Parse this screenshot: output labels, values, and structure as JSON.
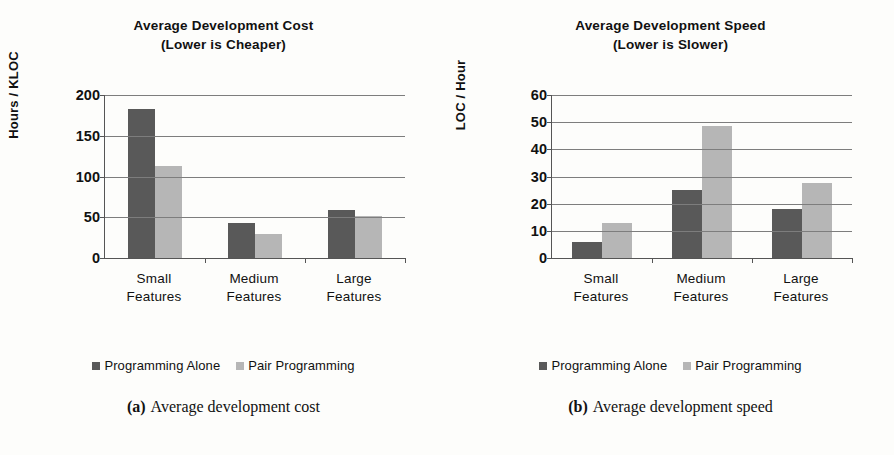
{
  "figures": [
    {
      "key": "cost",
      "title_line1": "Average Development Cost",
      "title_line2": "(Lower is Cheaper)",
      "caption_label": "(a)",
      "caption_text": "Average development cost",
      "legend": [
        {
          "label": "Programming Alone",
          "color": "#595959",
          "swatch": "dark"
        },
        {
          "label": "Pair Programming",
          "color": "#b6b6b6",
          "swatch": "light"
        }
      ]
    },
    {
      "key": "speed",
      "title_line1": "Average Development Speed",
      "title_line2": "(Lower is Slower)",
      "caption_label": "(b)",
      "caption_text": "Average development speed",
      "legend": [
        {
          "label": "Programming Alone",
          "color": "#595959",
          "swatch": "dark"
        },
        {
          "label": "Pair Programming",
          "color": "#b6b6b6",
          "swatch": "light"
        }
      ]
    }
  ],
  "chart_data": [
    {
      "type": "bar",
      "key": "cost",
      "title": "Average Development Cost (Lower is Cheaper)",
      "xlabel": "",
      "ylabel": "Hours / KLOC",
      "categories": [
        "Small Features",
        "Medium Features",
        "Large Features"
      ],
      "category_lines": [
        [
          "Small",
          "Features"
        ],
        [
          "Medium",
          "Features"
        ],
        [
          "Large",
          "Features"
        ]
      ],
      "series": [
        {
          "name": "Programming Alone",
          "color": "#595959",
          "values": [
            183,
            43,
            59
          ]
        },
        {
          "name": "Pair Programming",
          "color": "#b6b6b6",
          "values": [
            113,
            29,
            52
          ]
        }
      ],
      "ylim": [
        0,
        200
      ],
      "yticks": [
        0,
        50,
        100,
        150,
        200
      ],
      "ytick_labels": [
        "0",
        "50",
        "100",
        "150",
        "200"
      ],
      "grid": true,
      "legend_position": "bottom"
    },
    {
      "type": "bar",
      "key": "speed",
      "title": "Average Development Speed (Lower is Slower)",
      "xlabel": "",
      "ylabel": "LOC / Hour",
      "categories": [
        "Small Features",
        "Medium Features",
        "Large Features"
      ],
      "category_lines": [
        [
          "Small",
          "Features"
        ],
        [
          "Medium",
          "Features"
        ],
        [
          "Large",
          "Features"
        ]
      ],
      "series": [
        {
          "name": "Programming Alone",
          "color": "#595959",
          "values": [
            6,
            25,
            18
          ]
        },
        {
          "name": "Pair Programming",
          "color": "#b6b6b6",
          "values": [
            13,
            48.5,
            27.5
          ]
        }
      ],
      "ylim": [
        0,
        60
      ],
      "yticks": [
        0,
        10,
        20,
        30,
        40,
        50,
        60
      ],
      "ytick_labels": [
        "0",
        "10",
        "20",
        "30",
        "40",
        "50",
        "60"
      ],
      "grid": true,
      "legend_position": "bottom"
    }
  ]
}
